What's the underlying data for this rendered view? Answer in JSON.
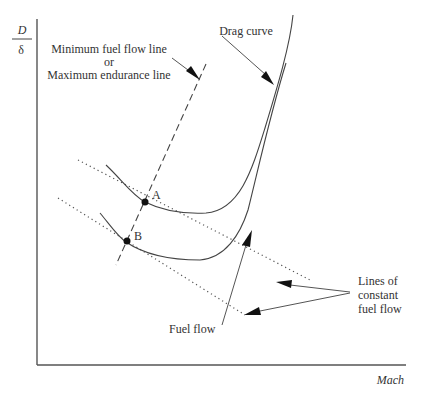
{
  "figure": {
    "y_axis_label_numerator": "D",
    "y_axis_label_denominator": "δ",
    "x_axis_label": "Mach"
  },
  "annotations": {
    "min_fuel_line_1": "Minimum fuel flow line",
    "min_fuel_line_2": "or",
    "min_fuel_line_3": "Maximum endurance line",
    "drag_curve": "Drag curve",
    "fuel_flow": "Fuel flow",
    "constant_fuel_1": "Lines of",
    "constant_fuel_2": "constant",
    "constant_fuel_3": "fuel flow"
  },
  "points": {
    "A": "A",
    "B": "B"
  },
  "elements": {
    "drag_curves": [
      "upper drag curve",
      "lower drag curve"
    ],
    "constant_fuel_flow_lines": [
      "upper dotted line",
      "lower dotted line"
    ],
    "min_fuel_flow_line": "dashed tangent line through A and B"
  }
}
